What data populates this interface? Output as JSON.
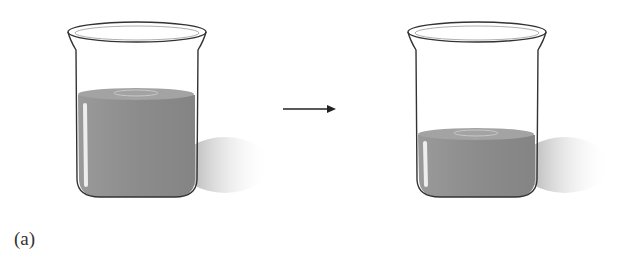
{
  "figure": {
    "label": "(a)",
    "arrow": "right-arrow",
    "beakers": [
      {
        "name": "beaker-before",
        "liquid_level": "high"
      },
      {
        "name": "beaker-after",
        "liquid_level": "low"
      }
    ],
    "colors": {
      "liquid": "#8f8f8f",
      "glass_outline": "#333333",
      "shadow": "#bdbdbd"
    }
  }
}
